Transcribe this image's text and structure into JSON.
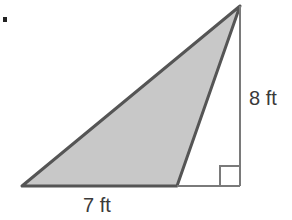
{
  "diagram": {
    "type": "triangle-area",
    "marker": "•",
    "labels": {
      "height": "8 ft",
      "base": "7 ft"
    },
    "colors": {
      "shaded_fill": "#c8c8c8",
      "stroke_dark": "#555555",
      "stroke_light": "#7a7a7a",
      "text": "#3a3a3a"
    },
    "vertices": {
      "apex": [
        240,
        6
      ],
      "bottom_left": [
        22,
        186
      ],
      "shaded_bottom_right": [
        177,
        186
      ],
      "right_angle_corner": [
        240,
        186
      ]
    },
    "right_angle_marker_size": 20
  }
}
